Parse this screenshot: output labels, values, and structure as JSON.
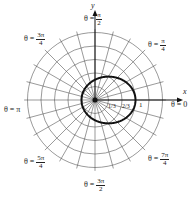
{
  "diagram": {
    "type": "polar-graph",
    "curve": "r = 1/(2 - cos θ)",
    "center_px": [
      95,
      100
    ],
    "ring_spacing_px": 13.5,
    "rings": 5,
    "spoke_step_deg": 15,
    "axes": {
      "x_label": "x",
      "y_label": "y"
    },
    "tick_labels": [
      "1/3",
      "2/3",
      "1"
    ],
    "angle_labels": [
      {
        "id": "pi2",
        "prefix": "θ =",
        "num": "π",
        "den": "2"
      },
      {
        "id": "pi4",
        "prefix": "θ =",
        "num": "π",
        "den": "4"
      },
      {
        "id": "3pi4",
        "prefix": "θ =",
        "num": "3π",
        "den": "4"
      },
      {
        "id": "pi",
        "text": "θ = π"
      },
      {
        "id": "zero",
        "text": "θ = 0"
      },
      {
        "id": "5pi4",
        "prefix": "θ =",
        "num": "5π",
        "den": "4"
      },
      {
        "id": "3pi2",
        "prefix": "θ =",
        "num": "3π",
        "den": "2"
      },
      {
        "id": "7pi4",
        "prefix": "θ =",
        "num": "7π",
        "den": "4"
      }
    ],
    "colors": {
      "grid": "#555555",
      "curve": "#111111",
      "axis": "#111111"
    }
  }
}
